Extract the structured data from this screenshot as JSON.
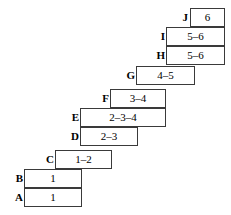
{
  "diagram": {
    "canvas": {
      "width": 231,
      "height": 215
    },
    "colors": {
      "box_border": "#3a3a3a",
      "box_fill": "#ffffff",
      "text": "#000000",
      "background": "#ffffff"
    },
    "rows": [
      {
        "id": "row-j",
        "label": "J",
        "value": "6",
        "label_x": 170,
        "label_width": 18,
        "box_x": 190,
        "box_width": 35,
        "y": 8
      },
      {
        "id": "row-i",
        "label": "I",
        "value": "5–6",
        "label_x": 147,
        "label_width": 18,
        "box_x": 166,
        "box_width": 59,
        "y": 27
      },
      {
        "id": "row-h",
        "label": "H",
        "value": "5–6",
        "label_x": 147,
        "label_width": 18,
        "box_x": 166,
        "box_width": 59,
        "y": 46
      },
      {
        "id": "row-g",
        "label": "G",
        "value": "4–5",
        "label_x": 117,
        "label_width": 18,
        "box_x": 136,
        "box_width": 59,
        "y": 66
      },
      {
        "id": "row-f",
        "label": "F",
        "value": "3–4",
        "label_x": 91,
        "label_width": 18,
        "box_x": 110,
        "box_width": 56,
        "y": 89
      },
      {
        "id": "row-e",
        "label": "E",
        "value": "2–3–4",
        "label_x": 61,
        "label_width": 18,
        "box_x": 80,
        "box_width": 86,
        "y": 108
      },
      {
        "id": "row-d",
        "label": "D",
        "value": "2–3",
        "label_x": 61,
        "label_width": 18,
        "box_x": 80,
        "box_width": 58,
        "y": 127
      },
      {
        "id": "row-c",
        "label": "C",
        "value": "1–2",
        "label_x": 36,
        "label_width": 18,
        "box_x": 55,
        "box_width": 57,
        "y": 150
      },
      {
        "id": "row-b",
        "label": "B",
        "value": "1",
        "label_x": 5,
        "label_width": 18,
        "box_x": 24,
        "box_width": 58,
        "y": 169
      },
      {
        "id": "row-a",
        "label": "A",
        "value": "1",
        "label_x": 5,
        "label_width": 18,
        "box_x": 24,
        "box_width": 58,
        "y": 188
      }
    ]
  }
}
